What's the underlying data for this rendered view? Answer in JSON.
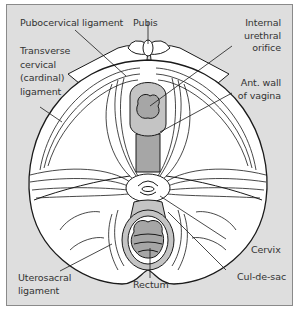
{
  "figure": {
    "background_color": "#dedede",
    "tissue_fill": "#ffffff",
    "organ_fill": "#a6a6a6",
    "organ_mid_fill": "#c4c4c4",
    "line_color": "#1a1a1a",
    "labels": {
      "pubocervical": "Pubocervical ligament",
      "pubis": "Pubis",
      "internal_urethral": [
        "Internal",
        "urethral",
        "orifice"
      ],
      "transverse_cervical": [
        "Transverse",
        "cervical",
        "(cardinal)",
        "ligament"
      ],
      "ant_wall_vagina": [
        "Ant. wall",
        "of vagina"
      ],
      "cervix": "Cervix",
      "cul_de_sac": "Cul-de-sac",
      "uterosacral": [
        "Uterosacral",
        "ligament"
      ],
      "rectum": "Rectum"
    }
  }
}
